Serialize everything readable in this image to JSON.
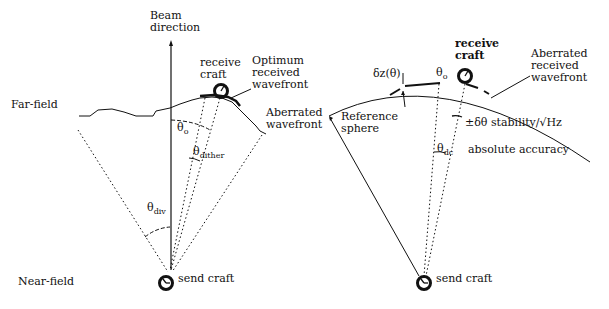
{
  "left_panel": {
    "beam_direction": [
      "Beam",
      "direction"
    ],
    "far_field": "Far-field",
    "near_field": "Near-field",
    "receive_craft": [
      "receive",
      "craft"
    ],
    "optimum_wavefront": [
      "Optimum",
      "received",
      "wavefront"
    ],
    "aberrated_wavefront": [
      "Aberrated",
      "wavefront"
    ],
    "theta_o": "θ",
    "theta_o_sub": "o",
    "theta_dither": "θ",
    "theta_dither_sub": "dither",
    "theta_div": "θ",
    "theta_div_sub": "div",
    "send_craft": "send craft"
  },
  "right_panel": {
    "receive_craft": [
      "receive",
      "craft"
    ],
    "aberrated_received_wavefront": [
      "Aberrated",
      "received",
      "wavefront"
    ],
    "delta_z": "δz(θ)",
    "theta_o": "θ",
    "theta_o_sub": "o",
    "reference_sphere": [
      "Reference",
      "sphere"
    ],
    "stability": "±δθ  stability/√Hz",
    "theta_dc": "θ",
    "theta_dc_sub": "dc",
    "absolute_accuracy": "absolute accuracy",
    "send_craft": "send craft"
  },
  "colors": {
    "ink": "#111111",
    "background": "#ffffff"
  }
}
